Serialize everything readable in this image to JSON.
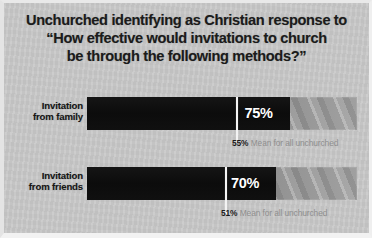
{
  "title": {
    "line1": "Unchurched identifying as Christian response to",
    "line2": "“How effective would invitations to church",
    "line3": "be through the following methods?”"
  },
  "colors": {
    "panel_background": "#c9c9c9",
    "bar_fill": "#101010",
    "bar_track": "#9d9d9d",
    "value_text": "#ffffff",
    "mean_tick": "#f4f4f4",
    "mean_pct_text": "#1b1b1b",
    "mean_label_text": "#8e8e8e",
    "title_text": "#1b1b1b"
  },
  "rows": [
    {
      "label_line1": "Invitation",
      "label_line2": "from family",
      "value_label": "75%",
      "mean_pct": "55%",
      "mean_text": "Mean for all unchurched"
    },
    {
      "label_line1": "Invitation",
      "label_line2": "from friends",
      "value_label": "70%",
      "mean_pct": "51%",
      "mean_text": "Mean for all unchurched"
    }
  ],
  "chart_data": {
    "type": "bar",
    "title": "Unchurched identifying as Christian response to “How effective would invitations to church be through the following methods?”",
    "orientation": "horizontal",
    "xlabel": "",
    "ylabel": "",
    "xlim": [
      0,
      100
    ],
    "grid": false,
    "legend": null,
    "categories": [
      "Invitation from family",
      "Invitation from friends"
    ],
    "values": [
      75,
      70
    ],
    "value_labels": [
      "75%",
      "70%"
    ],
    "unit": "percent",
    "series": [
      {
        "name": "Unchurched identifying as Christian",
        "values": [
          75,
          70
        ]
      },
      {
        "name": "Mean for all unchurched",
        "values": [
          55,
          51
        ],
        "render": "tick-marker"
      }
    ],
    "annotations": [
      {
        "category": "Invitation from family",
        "text": "55% Mean for all unchurched",
        "value": 55
      },
      {
        "category": "Invitation from friends",
        "text": "51% Mean for all unchurched",
        "value": 51
      }
    ]
  }
}
